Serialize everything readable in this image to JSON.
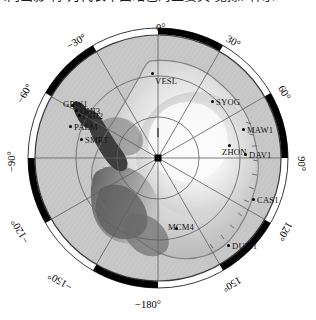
{
  "caption": {
    "text": "(两出影 特 为代表十面站色的主要关 觉豫, 种示"
  },
  "figure": {
    "projection": "polar-stereographic",
    "pole_marker": "south-pole-marker",
    "colors": {
      "land_light": "#f2f2f2",
      "land_mid": "#b9b9b9",
      "land_dark": "#4a4a4a",
      "ocean": "#c9c9c9",
      "rim_black": "#000000",
      "graticule": "#5a5a5a",
      "station_dot": "#000000",
      "background": "#ffffff"
    },
    "longitude_labels": [
      {
        "label": "0°",
        "x": 156,
        "y": 8,
        "rot": 0
      },
      {
        "label": "30°",
        "x": 226,
        "y": 22,
        "rot": 30
      },
      {
        "label": "60°",
        "x": 277,
        "y": 73,
        "rot": 60
      },
      {
        "label": "90°",
        "x": 294,
        "y": 144,
        "rot": 90
      },
      {
        "label": "120°",
        "x": 275,
        "y": 212,
        "rot": 120
      },
      {
        "label": "150°",
        "x": 222,
        "y": 265,
        "rot": 150
      },
      {
        "label": "−180°",
        "x": 135,
        "y": 285,
        "rot": 0
      },
      {
        "label": "−150°",
        "x": 47,
        "y": 262,
        "rot": -150
      },
      {
        "label": "−120°",
        "x": 7,
        "y": 212,
        "rot": -120
      },
      {
        "label": "−90°",
        "x": 1,
        "y": 142,
        "rot": -90
      },
      {
        "label": "−60°",
        "x": 14,
        "y": 74,
        "rot": -60
      },
      {
        "label": "−30°",
        "x": 66,
        "y": 22,
        "rot": -30
      }
    ],
    "stations": [
      {
        "code": "VESL",
        "dx": 152,
        "dy": 59,
        "lx": 155,
        "ly": 62,
        "anchor": "left"
      },
      {
        "code": "SYOG",
        "dx": 212,
        "dy": 87,
        "lx": 216,
        "ly": 83,
        "anchor": "left"
      },
      {
        "code": "MAW1",
        "dx": 243,
        "dy": 115,
        "lx": 247,
        "ly": 111,
        "anchor": "left"
      },
      {
        "code": "ZHON",
        "dx": 229,
        "dy": 131,
        "lx": 222,
        "ly": 133,
        "anchor": "left"
      },
      {
        "code": "DAV1",
        "dx": 245,
        "dy": 140,
        "lx": 249,
        "ly": 136,
        "anchor": "left"
      },
      {
        "code": "CAS1",
        "dx": 253,
        "dy": 185,
        "lx": 257,
        "ly": 181,
        "anchor": "left"
      },
      {
        "code": "DUM1",
        "dx": 228,
        "dy": 231,
        "lx": 232,
        "ly": 227,
        "anchor": "left"
      },
      {
        "code": "MCM4",
        "dx": 176,
        "dy": 214,
        "lx": 168,
        "ly": 208,
        "anchor": "left"
      },
      {
        "code": "GRW1",
        "dx": 72,
        "dy": 91,
        "lx": 63,
        "ly": 85,
        "anchor": "left"
      },
      {
        "code": "OHI3",
        "dx": 76,
        "dy": 96,
        "lx": 80,
        "ly": 92,
        "anchor": "left"
      },
      {
        "code": "OHI2",
        "dx": 79,
        "dy": 101,
        "lx": 83,
        "ly": 97,
        "anchor": "left"
      },
      {
        "code": "PALM",
        "dx": 70,
        "dy": 112,
        "lx": 74,
        "ly": 108,
        "anchor": "left"
      },
      {
        "code": "SMRT",
        "dx": 81,
        "dy": 125,
        "lx": 85,
        "ly": 121,
        "anchor": "left"
      }
    ]
  }
}
